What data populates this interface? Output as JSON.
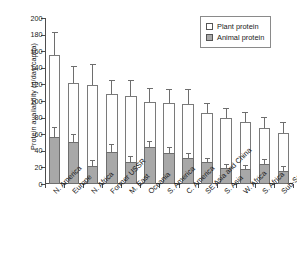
{
  "chart_data": {
    "type": "bar",
    "subtype": "stacked-bar-with-error-bars",
    "title": "",
    "xlabel": "",
    "ylabel": "Protein availability (g/day/capita)",
    "ylim": [
      0,
      200
    ],
    "ytick_step": 20,
    "yticks": [
      0,
      20,
      40,
      60,
      80,
      100,
      120,
      140,
      160,
      180,
      200
    ],
    "ytick_labels": [
      "0",
      "20",
      "40",
      "60",
      "80",
      "100",
      "120",
      "140",
      "160",
      "180",
      "200"
    ],
    "grid": false,
    "legend_position": "top-right",
    "categories": [
      "N. America",
      "Europe",
      "N. Africa",
      "Former USSR",
      "M. East",
      "Oceania",
      "S. America",
      "C. America",
      "SE Asia and China",
      "S. Asia",
      "W. Africa",
      "S. Africa",
      "Sub-Sah Africa"
    ],
    "series": [
      {
        "name": "Animal protein",
        "color": "#a8a8a8",
        "values": [
          57,
          51,
          22,
          39,
          26,
          45,
          37,
          31,
          26,
          19,
          18,
          24,
          16
        ],
        "errors_upper": [
          10,
          8,
          6,
          8,
          6,
          6,
          6,
          5,
          4,
          4,
          4,
          5,
          4
        ]
      },
      {
        "name": "Plant protein",
        "color": "#ffffff",
        "values": [
          98,
          71,
          97,
          69,
          80,
          54,
          61,
          66,
          59,
          60,
          57,
          44,
          46
        ]
      }
    ],
    "totals": [
      155,
      122,
      119,
      108,
      106,
      99,
      98,
      97,
      85,
      79,
      75,
      68,
      62
    ],
    "totals_errors_upper": [
      27,
      19,
      24,
      16,
      18,
      16,
      15,
      16,
      11,
      11,
      11,
      11,
      11
    ]
  },
  "legend": {
    "items": [
      {
        "label": "Plant protein",
        "swatch": "white-square-outline"
      },
      {
        "label": "Animal protein",
        "swatch": "gray-filled-square"
      }
    ]
  },
  "colors": {
    "animal_fill": "#a8a8a8",
    "plant_fill": "#ffffff",
    "bar_stroke": "#6e6e6e",
    "axis": "#4d4d4d",
    "text": "#1a1a1a",
    "background": "#ffffff"
  }
}
